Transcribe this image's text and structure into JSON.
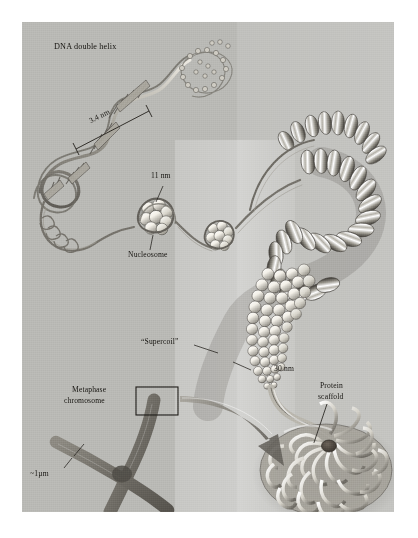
{
  "figure": {
    "medium": "pencil / airbrush scientific illustration",
    "panel_background_color": "#b9b9b5",
    "ink_color": "#15130f",
    "page_background_color": "#ffffff"
  },
  "labels": {
    "dna_double_helix": "DNA double helix",
    "scale_3_4nm": "3.4 nm",
    "scale_11nm": "11 nm",
    "nucleosome": "Nucleosome",
    "supercoil": "“Supercoil”",
    "scale_30nm": "30 nm",
    "metaphase_line1": "Metaphase",
    "metaphase_line2": "chromosome",
    "scale_1um": "~1µm",
    "protein_scaffold_line1": "Protein",
    "protein_scaffold_line2": "scaffold"
  },
  "structures": [
    {
      "name": "dna-double-helix",
      "label": "DNA double helix",
      "scale": "3.4 nm",
      "description": "Right-handed double helix with base-pair rungs, fading into a ball-and-stick atomic model at upper right"
    },
    {
      "name": "nucleosome-beads-on-a-string",
      "label": "Nucleosome",
      "scale": "11 nm",
      "description": "Histone octamer core particles with DNA wrapped around, connected by linker DNA"
    },
    {
      "name": "solenoid-supercoil-fiber",
      "label": "“Supercoil”",
      "scale": "30 nm",
      "description": "Nucleosomes coiled into a helical 30 nm solenoid fiber"
    },
    {
      "name": "looped-domain-rosette",
      "label": "Protein scaffold",
      "scale": "",
      "description": "30 nm fiber anchored in radial loops around a central non-histone protein scaffold"
    },
    {
      "name": "metaphase-chromosome",
      "label": "Metaphase chromosome",
      "scale": "~1µm",
      "description": "X-shaped condensed chromosome with two sister chromatids joined at the centromere; boxed region magnified by the arrow"
    }
  ],
  "annotations": {
    "callout_box": "rectangle around upper-left chromatid arm",
    "callout_arrow": "curved tapering arrow from boxed chromosome region to the looped-domain rosette"
  }
}
